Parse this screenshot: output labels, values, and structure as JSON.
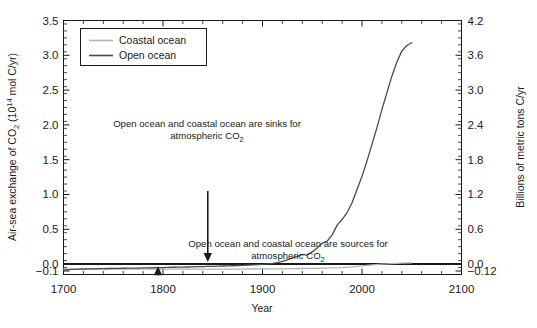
{
  "chart_data": {
    "type": "line",
    "title": "",
    "xlabel": "Year",
    "ylabel": "Air-sea exchange of CO2 (10^14 mol C/yr)",
    "ylabel_right": "Billions of metric tons C/yr",
    "xlim": [
      1700,
      2100
    ],
    "ylim": [
      -0.15,
      3.5
    ],
    "ylim_right": [
      -0.18,
      4.2
    ],
    "grid": false,
    "legend_position": "top-left",
    "x_ticks": [
      1700,
      1800,
      1900,
      2000,
      2100
    ],
    "x_tick_labels": [
      "1700",
      "1800",
      "1900",
      "2000",
      "2100"
    ],
    "y_ticks_left": [
      3.5,
      3.0,
      2.5,
      2.0,
      1.5,
      1.0,
      0.5,
      0.0,
      -0.1
    ],
    "y_tick_labels_left": [
      "3.5",
      "3.0",
      "2.5",
      "2.0",
      "1.5",
      "1.0",
      "0.5",
      "0.0",
      "−0.1"
    ],
    "y_ticks_right": [
      4.2,
      3.6,
      3.0,
      2.4,
      1.8,
      1.2,
      0.6,
      0.0,
      -0.12
    ],
    "y_tick_labels_right": [
      "4.2",
      "3.6",
      "3.0",
      "2.4",
      "1.8",
      "1.2",
      "0.6",
      "0.0",
      "−0.12"
    ],
    "zero_line": 0.0,
    "series": [
      {
        "name": "Coastal ocean",
        "color": "#b4b4b4",
        "x": [
          1700,
          1710,
          1720,
          1730,
          1740,
          1750,
          1760,
          1770,
          1780,
          1790,
          1800,
          1810,
          1820,
          1830,
          1840,
          1850,
          1860,
          1870,
          1880,
          1890,
          1900,
          1910,
          1920,
          1930,
          1940,
          1950,
          1960,
          1970,
          1980,
          1990,
          2000,
          2010,
          2020,
          2030,
          2040,
          2050
        ],
        "y": [
          -0.072,
          -0.072,
          -0.072,
          -0.072,
          -0.072,
          -0.072,
          -0.072,
          -0.072,
          -0.072,
          -0.072,
          -0.072,
          -0.072,
          -0.072,
          -0.072,
          -0.072,
          -0.072,
          -0.072,
          -0.072,
          -0.072,
          -0.071,
          -0.07,
          -0.069,
          -0.068,
          -0.066,
          -0.064,
          -0.061,
          -0.058,
          -0.055,
          -0.05,
          -0.04,
          -0.026,
          -0.012,
          -0.002,
          0.006,
          0.013,
          0.018
        ]
      },
      {
        "name": "Open ocean",
        "color": "#4a4a4a",
        "x": [
          1700,
          1705,
          1710,
          1715,
          1720,
          1725,
          1730,
          1735,
          1740,
          1745,
          1750,
          1755,
          1760,
          1765,
          1770,
          1775,
          1780,
          1785,
          1790,
          1795,
          1800,
          1805,
          1810,
          1815,
          1820,
          1825,
          1830,
          1835,
          1840,
          1845,
          1850,
          1855,
          1860,
          1865,
          1870,
          1875,
          1880,
          1885,
          1890,
          1895,
          1900,
          1905,
          1910,
          1915,
          1920,
          1925,
          1930,
          1935,
          1940,
          1945,
          1950,
          1955,
          1960,
          1965,
          1970,
          1975,
          1980,
          1985,
          1990,
          1995,
          2000,
          2005,
          2010,
          2015,
          2020,
          2025,
          2030,
          2035,
          2040,
          2045,
          2050
        ],
        "y": [
          -0.085,
          -0.08,
          -0.076,
          -0.073,
          -0.071,
          -0.069,
          -0.068,
          -0.066,
          -0.065,
          -0.064,
          -0.062,
          -0.061,
          -0.06,
          -0.059,
          -0.058,
          -0.057,
          -0.056,
          -0.055,
          -0.053,
          -0.052,
          -0.05,
          -0.048,
          -0.046,
          -0.045,
          -0.043,
          -0.042,
          -0.04,
          -0.038,
          -0.036,
          -0.034,
          -0.032,
          -0.03,
          -0.028,
          -0.026,
          -0.024,
          -0.021,
          -0.018,
          -0.015,
          -0.012,
          -0.008,
          -0.004,
          0.002,
          0.01,
          0.022,
          0.04,
          0.06,
          0.09,
          0.11,
          0.14,
          0.13,
          0.175,
          0.23,
          0.3,
          0.33,
          0.42,
          0.56,
          0.64,
          0.74,
          0.88,
          1.07,
          1.26,
          1.48,
          1.72,
          1.96,
          2.22,
          2.46,
          2.7,
          2.9,
          3.06,
          3.14,
          3.18
        ]
      }
    ],
    "annotations": [
      {
        "id": "sink-annotation",
        "line1": "Open ocean and coastal ocean are sinks for",
        "line2_prefix": "atmospheric CO",
        "line2_sub": "2",
        "arrow": "down",
        "arrow_x_year": 1845,
        "arrow_from_value": 1.05,
        "arrow_to_value": 0.03
      },
      {
        "id": "source-annotation",
        "line1": "Open ocean and coastal ocean are sources for",
        "line2_prefix": "atmospheric CO",
        "line2_sub": "2",
        "arrow": "up",
        "arrow_x_year": 1795,
        "arrow_from_value": -0.125,
        "arrow_to_value": -0.03
      }
    ]
  },
  "axes": {
    "left_title_parts": {
      "a": "Air-sea exchange of CO",
      "sub1": "2",
      "b": " (10",
      "sup1": "14",
      "c": " mol C/yr)"
    },
    "right_title": "Billions of metric tons C/yr",
    "x_title": "Year"
  },
  "legend": {
    "items": [
      {
        "label": "Coastal ocean",
        "color": "#b4b4b4"
      },
      {
        "label": "Open ocean",
        "color": "#4a4a4a"
      }
    ]
  },
  "colors": {
    "axis": "#1a1a1a",
    "coastal": "#b4b4b4",
    "open": "#4a4a4a",
    "zero_line": "#1a1a1a",
    "background": "#ffffff"
  }
}
